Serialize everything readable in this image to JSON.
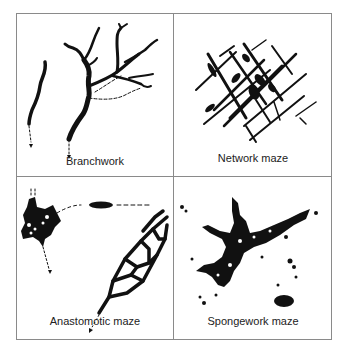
{
  "figure": {
    "panels": [
      {
        "label": "Branchwork",
        "position": "top-left"
      },
      {
        "label": "Network maze",
        "position": "top-right"
      },
      {
        "label": "Anastomotic maze",
        "position": "bottom-left"
      },
      {
        "label": "Spongework maze",
        "position": "bottom-right"
      }
    ],
    "colors": {
      "ink": "#111111",
      "border": "#8a8a8a",
      "background": "#ffffff"
    }
  }
}
